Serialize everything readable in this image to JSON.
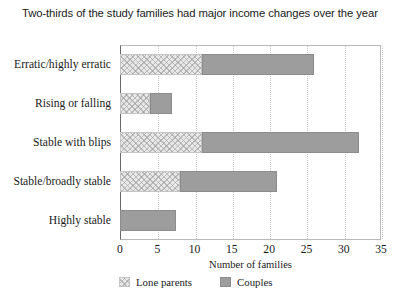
{
  "chart_data": {
    "type": "bar",
    "orientation": "horizontal",
    "stacked": true,
    "title": "Two-thirds of the study families had major income changes over the year",
    "xlabel": "Number of families",
    "ylabel": "",
    "xlim": [
      0,
      35
    ],
    "xticks": [
      0,
      5,
      10,
      15,
      20,
      25,
      30,
      35
    ],
    "grid": "vertical-dotted",
    "legend_position": "bottom-left",
    "categories": [
      "Erratic/highly erratic",
      "Rising or falling",
      "Stable with blips",
      "Stable/broadly stable",
      "Highly stable"
    ],
    "series": [
      {
        "name": "Lone parents",
        "color": "#e8e8e8",
        "pattern": "crosshatch",
        "values": [
          11,
          4,
          11,
          8,
          0
        ]
      },
      {
        "name": "Couples",
        "color": "#9d9d9d",
        "pattern": "solid",
        "values": [
          15,
          3,
          21,
          13,
          7.5
        ]
      }
    ],
    "totals": [
      26,
      7,
      32,
      21,
      7.5
    ]
  },
  "axis": {
    "tick_labels": [
      "0",
      "5",
      "10",
      "15",
      "20",
      "25",
      "30",
      "35"
    ]
  },
  "legend": {
    "items": [
      {
        "label": "Lone parents"
      },
      {
        "label": "Couples"
      }
    ]
  }
}
